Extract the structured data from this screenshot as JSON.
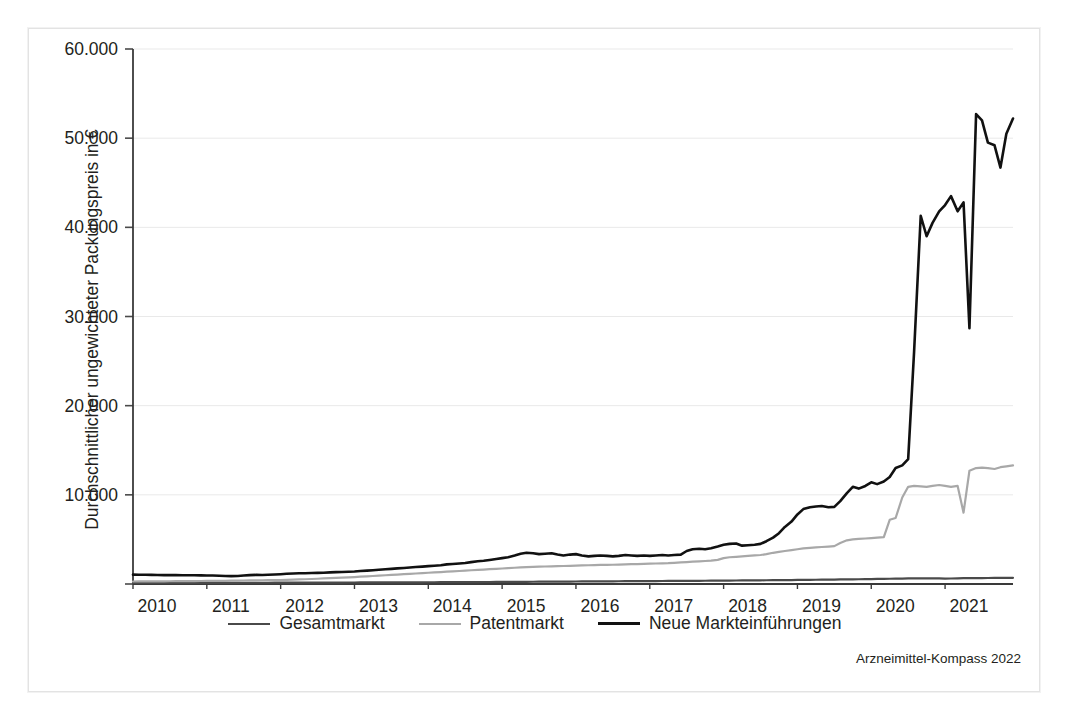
{
  "source_note": "Arzneimittel-Kompass 2022",
  "axis": {
    "y_title": "Durchschnittlicher ungewichteter Packungspreis in €",
    "y_ticks": [
      "60.000",
      "50.000",
      "40.000",
      "30.000",
      "20.000",
      "10.000"
    ],
    "x_ticks": [
      "2010",
      "2011",
      "2012",
      "2013",
      "2014",
      "2015",
      "2016",
      "2017",
      "2018",
      "2019",
      "2020",
      "2021"
    ]
  },
  "legend": {
    "items": [
      {
        "label": "Gesamtmarkt",
        "color": "#4a4a4a",
        "width": 2.6
      },
      {
        "label": "Patentmarkt",
        "color": "#a8a8a8",
        "width": 2.6
      },
      {
        "label": "Neue Markteinführungen",
        "color": "#111111",
        "width": 3.0
      }
    ]
  },
  "chart_data": {
    "type": "line",
    "title": "",
    "xlabel": "",
    "ylabel": "Durchschnittlicher ungewichteter Packungspreis in €",
    "xlim": [
      2010.0,
      2021.92
    ],
    "ylim": [
      0,
      60000
    ],
    "yticks": [
      10000,
      20000,
      30000,
      40000,
      50000,
      60000
    ],
    "xticks": [
      2010,
      2011,
      2012,
      2013,
      2014,
      2015,
      2016,
      2017,
      2018,
      2019,
      2020,
      2021
    ],
    "grid": "horizontal",
    "legend_position": "bottom-center",
    "annotations": [
      "Arzneimittel-Kompass 2022"
    ],
    "x": [
      2010.0,
      2010.08,
      2010.17,
      2010.25,
      2010.33,
      2010.42,
      2010.5,
      2010.58,
      2010.67,
      2010.75,
      2010.83,
      2010.92,
      2011.0,
      2011.08,
      2011.17,
      2011.25,
      2011.33,
      2011.42,
      2011.5,
      2011.58,
      2011.67,
      2011.75,
      2011.83,
      2011.92,
      2012.0,
      2012.08,
      2012.17,
      2012.25,
      2012.33,
      2012.42,
      2012.5,
      2012.58,
      2012.67,
      2012.75,
      2012.83,
      2012.92,
      2013.0,
      2013.08,
      2013.17,
      2013.25,
      2013.33,
      2013.42,
      2013.5,
      2013.58,
      2013.67,
      2013.75,
      2013.83,
      2013.92,
      2014.0,
      2014.08,
      2014.17,
      2014.25,
      2014.33,
      2014.42,
      2014.5,
      2014.58,
      2014.67,
      2014.75,
      2014.83,
      2014.92,
      2015.0,
      2015.08,
      2015.17,
      2015.25,
      2015.33,
      2015.42,
      2015.5,
      2015.58,
      2015.67,
      2015.75,
      2015.83,
      2015.92,
      2016.0,
      2016.08,
      2016.17,
      2016.25,
      2016.33,
      2016.42,
      2016.5,
      2016.58,
      2016.67,
      2016.75,
      2016.83,
      2016.92,
      2017.0,
      2017.08,
      2017.17,
      2017.25,
      2017.33,
      2017.42,
      2017.5,
      2017.58,
      2017.67,
      2017.75,
      2017.83,
      2017.92,
      2018.0,
      2018.08,
      2018.17,
      2018.25,
      2018.33,
      2018.42,
      2018.5,
      2018.58,
      2018.67,
      2018.75,
      2018.83,
      2018.92,
      2019.0,
      2019.08,
      2019.17,
      2019.25,
      2019.33,
      2019.42,
      2019.5,
      2019.58,
      2019.67,
      2019.75,
      2019.83,
      2019.92,
      2020.0,
      2020.08,
      2020.17,
      2020.25,
      2020.33,
      2020.42,
      2020.5,
      2020.58,
      2020.67,
      2020.75,
      2020.83,
      2020.92,
      2021.0,
      2021.08,
      2021.17,
      2021.25,
      2021.33,
      2021.42,
      2021.5,
      2021.58,
      2021.67,
      2021.75,
      2021.83,
      2021.92
    ],
    "series": [
      {
        "name": "Neue Markteinführungen",
        "color": "#111111",
        "values": [
          1050,
          1040,
          1030,
          1020,
          1010,
          1000,
          995,
          990,
          985,
          980,
          975,
          970,
          960,
          950,
          930,
          900,
          880,
          900,
          950,
          1000,
          1020,
          1010,
          1030,
          1060,
          1100,
          1150,
          1180,
          1200,
          1210,
          1230,
          1250,
          1270,
          1300,
          1330,
          1350,
          1380,
          1400,
          1450,
          1500,
          1550,
          1600,
          1650,
          1700,
          1750,
          1800,
          1850,
          1900,
          1950,
          2000,
          2050,
          2100,
          2200,
          2250,
          2300,
          2350,
          2450,
          2550,
          2600,
          2700,
          2800,
          2900,
          3000,
          3200,
          3400,
          3500,
          3450,
          3350,
          3400,
          3450,
          3300,
          3200,
          3300,
          3350,
          3200,
          3100,
          3150,
          3200,
          3150,
          3100,
          3150,
          3250,
          3200,
          3150,
          3200,
          3150,
          3200,
          3250,
          3200,
          3250,
          3300,
          3700,
          3900,
          3950,
          3900,
          4000,
          4200,
          4400,
          4500,
          4550,
          4300,
          4350,
          4400,
          4500,
          4800,
          5200,
          5700,
          6400,
          7000,
          7800,
          8400,
          8600,
          8700,
          8750,
          8600,
          8650,
          9300,
          10200,
          10900,
          10700,
          11000,
          11400,
          11200,
          11500,
          12000,
          13000,
          13300,
          14000,
          26000,
          41300,
          39000,
          40500,
          41800,
          42500,
          43500,
          41800,
          42800,
          28700,
          52700,
          52000,
          49500,
          49200,
          46700,
          50500,
          52200
        ]
      },
      {
        "name": "Patentmarkt",
        "color": "#a8a8a8",
        "values": [
          280,
          285,
          290,
          295,
          300,
          305,
          310,
          315,
          320,
          325,
          330,
          335,
          340,
          345,
          350,
          360,
          370,
          380,
          390,
          400,
          410,
          420,
          430,
          440,
          450,
          470,
          490,
          510,
          530,
          560,
          590,
          620,
          650,
          680,
          710,
          740,
          780,
          820,
          860,
          900,
          940,
          980,
          1020,
          1060,
          1100,
          1140,
          1180,
          1220,
          1260,
          1300,
          1340,
          1380,
          1420,
          1460,
          1500,
          1540,
          1580,
          1620,
          1660,
          1700,
          1740,
          1780,
          1820,
          1860,
          1900,
          1920,
          1940,
          1960,
          1980,
          2000,
          2020,
          2040,
          2060,
          2080,
          2100,
          2120,
          2140,
          2150,
          2160,
          2180,
          2200,
          2220,
          2240,
          2260,
          2280,
          2300,
          2320,
          2340,
          2380,
          2420,
          2460,
          2500,
          2540,
          2580,
          2620,
          2700,
          2900,
          3000,
          3050,
          3100,
          3150,
          3200,
          3250,
          3350,
          3500,
          3600,
          3700,
          3800,
          3900,
          4000,
          4050,
          4100,
          4150,
          4200,
          4250,
          4600,
          4900,
          5000,
          5050,
          5100,
          5150,
          5200,
          5250,
          7200,
          7400,
          9700,
          10900,
          11000,
          10950,
          10900,
          11000,
          11100,
          11000,
          10900,
          11000,
          8000,
          12700,
          13000,
          13050,
          13000,
          12900,
          13100,
          13200,
          13300
        ]
      },
      {
        "name": "Gesamtmarkt",
        "color": "#4a4a4a",
        "values": [
          120,
          121,
          122,
          123,
          124,
          125,
          126,
          127,
          128,
          129,
          130,
          131,
          132,
          133,
          134,
          135,
          136,
          137,
          138,
          139,
          140,
          141,
          142,
          143,
          145,
          147,
          149,
          151,
          153,
          155,
          157,
          159,
          161,
          163,
          165,
          167,
          170,
          172,
          174,
          176,
          178,
          180,
          182,
          184,
          186,
          188,
          190,
          192,
          195,
          198,
          201,
          204,
          207,
          210,
          213,
          216,
          219,
          222,
          225,
          228,
          232,
          236,
          240,
          244,
          248,
          252,
          256,
          260,
          264,
          268,
          272,
          276,
          280,
          284,
          288,
          292,
          296,
          300,
          304,
          308,
          312,
          316,
          320,
          324,
          328,
          332,
          336,
          340,
          344,
          348,
          352,
          356,
          360,
          364,
          368,
          372,
          378,
          384,
          390,
          396,
          402,
          408,
          414,
          420,
          426,
          432,
          438,
          444,
          452,
          460,
          468,
          476,
          484,
          492,
          500,
          508,
          516,
          524,
          532,
          540,
          552,
          564,
          576,
          588,
          600,
          612,
          620,
          625,
          628,
          630,
          632,
          634,
          610,
          615,
          640,
          650,
          660,
          665,
          670,
          675,
          680,
          685,
          690,
          695
        ]
      }
    ]
  }
}
